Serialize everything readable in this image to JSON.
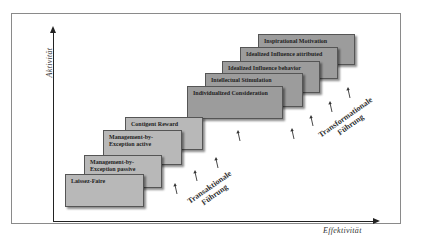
{
  "diagram": {
    "y_axis_label": "Aktivität",
    "x_axis_label": "Effektivität",
    "transactional_group": {
      "label_line1": "Transaktionale",
      "label_line2": "Führung",
      "boxes": [
        {
          "label": "Laissez-Faire"
        },
        {
          "label": "Management-by-Exception passive"
        },
        {
          "label": "Management-by-Exception active"
        },
        {
          "label": "Contigent Reward"
        }
      ]
    },
    "transformational_group": {
      "label_line1": "Transformationale",
      "label_line2": "Führung",
      "boxes": [
        {
          "label": "Individualized Consideration"
        },
        {
          "label": "Intellectual Stimulation"
        },
        {
          "label": "Idealized Influence behavior"
        },
        {
          "label": "Idealized Influence attributed"
        },
        {
          "label": "Inspirational Motivation"
        }
      ]
    },
    "colors": {
      "transactional_box": "#b8b8b8",
      "transformational_box": "#9c9c9c",
      "axis": "#222222",
      "frame": "#8a8a8a"
    }
  }
}
